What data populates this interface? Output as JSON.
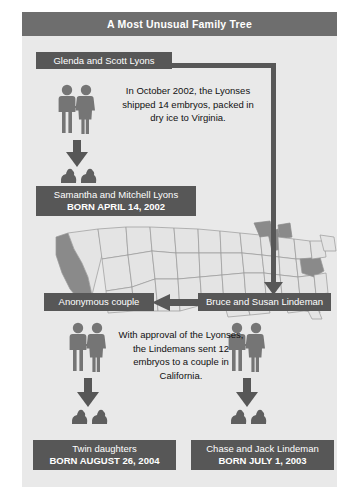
{
  "title": "A Most Unusual Family Tree",
  "nodes": {
    "lyons": {
      "name": "Glenda and Scott Lyons"
    },
    "samantha": {
      "name": "Samantha and Mitchell Lyons",
      "born": "BORN APRIL 14, 2002"
    },
    "anonymous": {
      "name": "Anonymous couple"
    },
    "lindeman": {
      "name": "Bruce and Susan Lindeman"
    },
    "twins": {
      "name": "Twin daughters",
      "born": "BORN AUGUST 26, 2004"
    },
    "chase": {
      "name": "Chase and Jack Lindeman",
      "born": "BORN JULY 1, 2003"
    }
  },
  "annotations": {
    "top": "In October 2002, the Lyonses shipped 14 embryos, packed in dry ice to Virginia.",
    "middle": "With approval of the Lyonses, the Lindemans sent 12 embryos to a couple in California."
  },
  "map": {
    "highlighted_states": [
      "California",
      "Virginia"
    ],
    "region": "United States"
  },
  "colors": {
    "header_bar": "#6e6e6e",
    "label_box": "#575757",
    "panel_background": "#e9e9e9",
    "map_land": "#e4e4e4",
    "map_highlight": "#8a8a8a",
    "arrow": "#575757",
    "text_light": "#ffffff",
    "text_dark": "#111111"
  }
}
